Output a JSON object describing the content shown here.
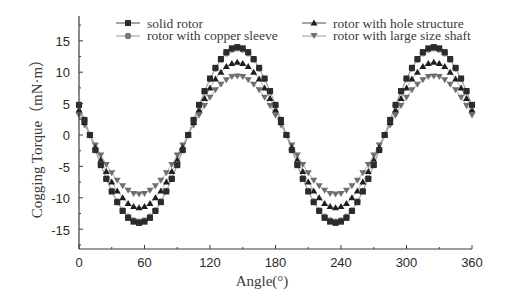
{
  "chart_data": {
    "type": "line",
    "title": "",
    "xlabel": "Angle(°)",
    "ylabel": "Cogging Torque（mN·m）",
    "xlim": [
      0,
      360
    ],
    "ylim": [
      -18,
      18
    ],
    "xticks": [
      0,
      60,
      120,
      180,
      240,
      300,
      360
    ],
    "yticks": [
      -15,
      -10,
      -5,
      0,
      5,
      10,
      15
    ],
    "grid": false,
    "legend_position": "top, two columns",
    "x": [
      0,
      5,
      10,
      15,
      20,
      25,
      30,
      35,
      40,
      45,
      50,
      55,
      60,
      65,
      70,
      75,
      80,
      85,
      90,
      95,
      100,
      105,
      110,
      115,
      120,
      125,
      130,
      135,
      140,
      145,
      150,
      155,
      160,
      165,
      170,
      175,
      180,
      185,
      190,
      195,
      200,
      205,
      210,
      215,
      220,
      225,
      230,
      235,
      240,
      245,
      250,
      255,
      260,
      265,
      270,
      275,
      280,
      285,
      290,
      295,
      300,
      305,
      310,
      315,
      320,
      325,
      330,
      335,
      340,
      345,
      350,
      355,
      360
    ],
    "series": [
      {
        "name": "solid rotor",
        "marker": "square",
        "color": "#2b2b2b",
        "values": [
          4.8,
          2.4,
          0.0,
          -2.4,
          -4.8,
          -7.0,
          -9.0,
          -10.7,
          -12.1,
          -13.2,
          -13.8,
          -14.0,
          -13.8,
          -13.2,
          -12.1,
          -10.7,
          -9.0,
          -7.0,
          -4.8,
          -2.4,
          0.0,
          2.4,
          4.8,
          7.0,
          9.0,
          10.7,
          12.1,
          13.2,
          13.8,
          14.0,
          13.8,
          13.2,
          12.1,
          10.7,
          9.0,
          7.0,
          4.8,
          2.4,
          0.0,
          -2.4,
          -4.8,
          -7.0,
          -9.0,
          -10.7,
          -12.1,
          -13.2,
          -13.8,
          -14.0,
          -13.8,
          -13.2,
          -12.1,
          -10.7,
          -9.0,
          -7.0,
          -4.8,
          -2.4,
          0.0,
          2.4,
          4.8,
          7.0,
          9.0,
          10.7,
          12.1,
          13.2,
          13.8,
          14.0,
          13.8,
          13.2,
          12.1,
          10.7,
          9.0,
          7.0,
          4.8
        ]
      },
      {
        "name": "rotor with copper sleeve",
        "marker": "circle",
        "color": "#7a7a7a",
        "values": [
          4.7,
          2.4,
          0.0,
          -2.4,
          -4.7,
          -6.9,
          -8.9,
          -10.6,
          -12.0,
          -13.0,
          -13.6,
          -13.8,
          -13.6,
          -13.0,
          -12.0,
          -10.6,
          -8.9,
          -6.9,
          -4.7,
          -2.4,
          0.0,
          2.4,
          4.7,
          6.9,
          8.9,
          10.6,
          12.0,
          13.0,
          13.6,
          13.8,
          13.6,
          13.0,
          12.0,
          10.6,
          8.9,
          6.9,
          4.7,
          2.4,
          0.0,
          -2.4,
          -4.7,
          -6.9,
          -8.9,
          -10.6,
          -12.0,
          -13.0,
          -13.6,
          -13.8,
          -13.6,
          -13.0,
          -12.0,
          -10.6,
          -8.9,
          -6.9,
          -4.7,
          -2.4,
          0.0,
          2.4,
          4.7,
          6.9,
          8.9,
          10.6,
          12.0,
          13.0,
          13.6,
          13.8,
          13.6,
          13.0,
          12.0,
          10.6,
          8.9,
          6.9,
          4.7
        ]
      },
      {
        "name": "rotor with hole structure",
        "marker": "triangle-up",
        "color": "#1e1e1e",
        "values": [
          4.0,
          2.0,
          0.0,
          -2.0,
          -4.0,
          -5.8,
          -7.5,
          -8.9,
          -10.0,
          -10.9,
          -11.4,
          -11.6,
          -11.4,
          -10.9,
          -10.0,
          -8.9,
          -7.5,
          -5.8,
          -4.0,
          -2.0,
          0.0,
          2.0,
          4.0,
          5.8,
          7.5,
          8.9,
          10.0,
          10.9,
          11.4,
          11.6,
          11.4,
          10.9,
          10.0,
          8.9,
          7.5,
          5.8,
          4.0,
          2.0,
          0.0,
          -2.0,
          -4.0,
          -5.8,
          -7.5,
          -8.9,
          -10.0,
          -10.9,
          -11.4,
          -11.6,
          -11.4,
          -10.9,
          -10.0,
          -8.9,
          -7.5,
          -5.8,
          -4.0,
          -2.0,
          0.0,
          2.0,
          4.0,
          5.8,
          7.5,
          8.9,
          10.0,
          10.9,
          11.4,
          11.6,
          11.4,
          10.9,
          10.0,
          8.9,
          7.5,
          5.8,
          4.0
        ]
      },
      {
        "name": "rotor with large size shaft",
        "marker": "triangle-down",
        "color": "#6e6e6e",
        "values": [
          3.2,
          1.6,
          0.0,
          -1.6,
          -3.2,
          -4.7,
          -6.0,
          -7.2,
          -8.1,
          -8.8,
          -9.3,
          -9.4,
          -9.3,
          -8.8,
          -8.1,
          -7.2,
          -6.0,
          -4.7,
          -3.2,
          -1.6,
          0.0,
          1.6,
          3.2,
          4.7,
          6.0,
          7.2,
          8.1,
          8.8,
          9.3,
          9.4,
          9.3,
          8.8,
          8.1,
          7.2,
          6.0,
          4.7,
          3.2,
          1.6,
          0.0,
          -1.6,
          -3.2,
          -4.7,
          -6.0,
          -7.2,
          -8.1,
          -8.8,
          -9.3,
          -9.4,
          -9.3,
          -8.8,
          -8.1,
          -7.2,
          -6.0,
          -4.7,
          -3.2,
          -1.6,
          0.0,
          1.6,
          3.2,
          4.7,
          6.0,
          7.2,
          8.1,
          8.8,
          9.3,
          9.4,
          9.3,
          8.8,
          8.1,
          7.2,
          6.0,
          4.7,
          3.2
        ]
      }
    ]
  },
  "axes": {
    "x_title": "Angle(°)",
    "y_title": "Cogging Torque（mN·m）",
    "x_tick_labels": [
      "0",
      "60",
      "120",
      "180",
      "240",
      "300",
      "360"
    ],
    "y_tick_labels": [
      "15",
      "10",
      "5",
      "0",
      "-5",
      "-10",
      "-15"
    ]
  },
  "legend": {
    "items": [
      {
        "label": "solid rotor"
      },
      {
        "label": "rotor with copper sleeve"
      },
      {
        "label": "rotor with hole structure"
      },
      {
        "label": "rotor with large size shaft"
      }
    ]
  }
}
